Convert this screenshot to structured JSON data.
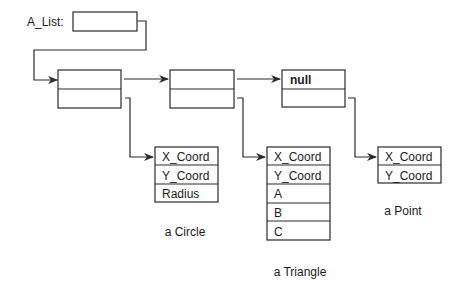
{
  "list_label": "A_List:",
  "nodes": [
    {
      "data": "",
      "next": ""
    },
    {
      "data": "",
      "next": ""
    },
    {
      "data": "null",
      "next": ""
    }
  ],
  "shapes": {
    "circle": {
      "fields": [
        "X_Coord",
        "Y_Coord",
        "Radius"
      ],
      "caption": "a Circle"
    },
    "triangle": {
      "fields": [
        "X_Coord",
        "Y_Coord",
        "A",
        "B",
        "C"
      ],
      "caption": "a Triangle"
    },
    "point": {
      "fields": [
        "X_Coord",
        "Y_Coord"
      ],
      "caption": "a Point"
    }
  }
}
